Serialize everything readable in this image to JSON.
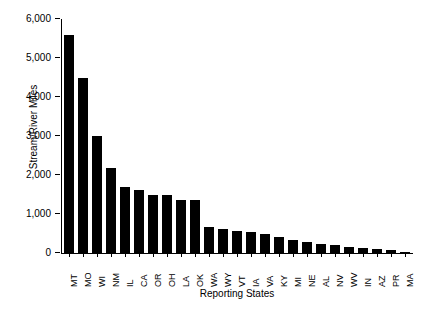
{
  "chart_data": {
    "type": "bar",
    "title": "",
    "xlabel": "Reporting States",
    "ylabel": "Stream/River Miles",
    "ylim": [
      0,
      6000
    ],
    "yticks": [
      0,
      1000,
      2000,
      3000,
      4000,
      5000,
      6000
    ],
    "ytick_labels": [
      "0",
      "1,000",
      "2,000",
      "3,000",
      "4,000",
      "5,000",
      "6,000"
    ],
    "grid": false,
    "legend": null,
    "bar_color": "#000000",
    "categories": [
      "MT",
      "MO",
      "WI",
      "NM",
      "IL",
      "CA",
      "OR",
      "OH",
      "LA",
      "OK",
      "WA",
      "WY",
      "VT",
      "IA",
      "VA",
      "KY",
      "MI",
      "NE",
      "AL",
      "NV",
      "WV",
      "IN",
      "AZ",
      "PR",
      "MA"
    ],
    "values": [
      5580,
      4480,
      2990,
      2180,
      1680,
      1620,
      1500,
      1480,
      1350,
      1350,
      660,
      610,
      560,
      530,
      480,
      420,
      330,
      280,
      220,
      195,
      165,
      140,
      110,
      75,
      30
    ],
    "series": [
      {
        "name": "Stream/River Miles",
        "values": [
          5580,
          4480,
          2990,
          2180,
          1680,
          1620,
          1500,
          1480,
          1350,
          1350,
          660,
          610,
          560,
          530,
          480,
          420,
          330,
          280,
          220,
          195,
          165,
          140,
          110,
          75,
          30
        ]
      }
    ]
  },
  "figure": {
    "caption_fragment": ""
  }
}
